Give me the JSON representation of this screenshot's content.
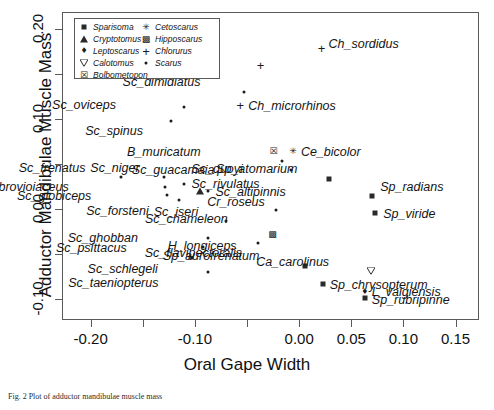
{
  "chart_data": {
    "type": "scatter",
    "title": "",
    "xlabel": "Oral Gape Width",
    "ylabel": "Adductor Mandibulae Muscle Mass",
    "xlim": [
      -0.2275,
      0.1725
    ],
    "ylim": [
      -0.1235,
      0.219
    ],
    "grid": false,
    "legend_position": "top-left",
    "xticks": [
      -0.2,
      -0.15,
      -0.1,
      -0.05,
      0.0,
      0.05,
      0.1,
      0.15
    ],
    "xticklabels": [
      "-0.20",
      "",
      "-0.10",
      "",
      "0.00",
      "0.05",
      "0.10",
      "0.15"
    ],
    "yticks": [
      -0.1,
      -0.05,
      0.0,
      0.05,
      0.1,
      0.15,
      0.2
    ],
    "yticklabels": [
      "-0.10",
      "",
      "0.00",
      "",
      "0.10",
      "",
      "0.20"
    ],
    "legend": [
      {
        "label": "Sparisoma",
        "marker": "square"
      },
      {
        "label": "Cryptotomus",
        "marker": "triangle"
      },
      {
        "label": "Leptoscarus",
        "marker": "diamond"
      },
      {
        "label": "Calotomus",
        "marker": "triangle-down"
      },
      {
        "label": "Bolbometopon",
        "marker": "crossed-square"
      },
      {
        "label": "Cetoscarus",
        "marker": "asterisk"
      },
      {
        "label": "Hipposcarus",
        "marker": "boxed-cross"
      },
      {
        "label": "Chlorurus",
        "marker": "plus"
      },
      {
        "label": "Scarus",
        "marker": "dot"
      }
    ],
    "points": [
      {
        "name": "Ch_sordidus",
        "genus": "Chlorurus",
        "marker": "plus",
        "x": 0.0215,
        "y": 0.179,
        "label_dx": 7,
        "label_dy": -4
      },
      {
        "name": "Ch_bleekeri",
        "genus": "Chlorurus",
        "marker": "plus",
        "x": -0.037,
        "y": 0.16,
        "label_dx": -80,
        "label_dy": -4
      },
      {
        "name": "Sc_dimidiatus",
        "genus": "Scarus",
        "marker": "dot",
        "x": -0.0525,
        "y": 0.1305,
        "label_dx": -44,
        "label_dy": -10
      },
      {
        "name": "Ch_microrhinos",
        "genus": "Chlorurus",
        "marker": "plus",
        "x": -0.0565,
        "y": 0.116,
        "label_dx": 8,
        "label_dy": 1
      },
      {
        "name": "Sc_oviceps",
        "genus": "Scarus",
        "marker": "dot",
        "x": -0.1105,
        "y": 0.1135,
        "label_dx": -68,
        "label_dy": -2
      },
      {
        "name": "Sc_spinus",
        "genus": "Scarus",
        "marker": "dot",
        "x": -0.123,
        "y": 0.0975,
        "label_dx": -28,
        "label_dy": 10
      },
      {
        "name": "B_muricatum",
        "genus": "Bolbometopon",
        "marker": "crossed-square",
        "x": -0.0245,
        "y": 0.0645,
        "label_dx": -73,
        "label_dy": 1
      },
      {
        "name": "Ce_bicolor",
        "genus": "Cetoscarus",
        "marker": "asterisk",
        "x": -0.006,
        "y": 0.0645,
        "label_dx": 8,
        "label_dy": 1
      },
      {
        "name": "Sc_guacamaia",
        "genus": "Scarus",
        "marker": "dot",
        "x": -0.016,
        "y": 0.053,
        "label_dx": -68,
        "label_dy": 9
      },
      {
        "name": "Sc_quoyi",
        "genus": "Scarus",
        "marker": "dot",
        "x": -0.008,
        "y": 0.043,
        "label_dx": -48,
        "label_dy": -1
      },
      {
        "name": "Sp_atomarium",
        "genus": "Sparisoma",
        "marker": "square",
        "x": 0.029,
        "y": 0.0335,
        "label_dx": -32,
        "label_dy": -10
      },
      {
        "name": "Sc_frenatus",
        "genus": "Scarus",
        "marker": "dot",
        "x": -0.1705,
        "y": 0.0355,
        "label_dx": -36,
        "label_dy": -9
      },
      {
        "name": "Sc_niger",
        "genus": "Scarus",
        "marker": "dot",
        "x": -0.13,
        "y": 0.0355,
        "label_dx": -24,
        "label_dy": -9
      },
      {
        "name": "Sc_rivulatus",
        "genus": "Scarus",
        "marker": "dot",
        "x": -0.11,
        "y": 0.028,
        "label_dx": 7,
        "label_dy": 0
      },
      {
        "name": "Sc_rubrovioiaceus",
        "genus": "Scarus",
        "marker": "dot",
        "x": -0.129,
        "y": 0.0245,
        "label_dx": -96,
        "label_dy": 0
      },
      {
        "name": "Sc_altipinnis",
        "genus": "Scarus",
        "marker": "dot",
        "x": -0.087,
        "y": 0.02,
        "label_dx": 7,
        "label_dy": 1
      },
      {
        "name": "Cr_roseus",
        "genus": "Cryptotomus",
        "marker": "triangle",
        "x": -0.095,
        "y": 0.0205,
        "label_dx": 7,
        "label_dy": 11
      },
      {
        "name": "Sc_globiceps",
        "genus": "Scarus",
        "marker": "dot",
        "x": -0.1265,
        "y": 0.0155,
        "label_dx": -76,
        "label_dy": 1
      },
      {
        "name": "Sc_forsteni",
        "genus": "Scarus",
        "marker": "dot",
        "x": -0.1155,
        "y": 0.01,
        "label_dx": -30,
        "label_dy": 11
      },
      {
        "name": "Sp_radians",
        "genus": "Sparisoma",
        "marker": "square",
        "x": 0.07,
        "y": 0.0145,
        "label_dx": 8,
        "label_dy": -9
      },
      {
        "name": "Sc_chameleon",
        "genus": "Scarus",
        "marker": "dot",
        "x": -0.0225,
        "y": -0.0015,
        "label_dx": -48,
        "label_dy": 9
      },
      {
        "name": "Sp_viride",
        "genus": "Sparisoma",
        "marker": "square",
        "x": 0.073,
        "y": -0.0045,
        "label_dx": 8,
        "label_dy": 1
      },
      {
        "name": "Sc_iseri",
        "genus": "Scarus",
        "marker": "dot",
        "x": -0.07,
        "y": -0.013,
        "label_dx": -28,
        "label_dy": -9
      },
      {
        "name": "H_longiceps",
        "genus": "Hipposcarus",
        "marker": "boxed-cross",
        "x": -0.0255,
        "y": -0.0275,
        "label_dx": -36,
        "label_dy": 12
      },
      {
        "name": "Sc_ghobban",
        "genus": "Scarus",
        "marker": "dot",
        "x": -0.0875,
        "y": -0.0325,
        "label_dx": -70,
        "label_dy": 0
      },
      {
        "name": "Sc_flavipectoralis",
        "genus": "Scarus",
        "marker": "dot",
        "x": -0.0395,
        "y": -0.0375,
        "label_dx": -16,
        "label_dy": 10
      },
      {
        "name": "Sc_psittacus",
        "genus": "Scarus",
        "marker": "dot",
        "x": -0.0925,
        "y": -0.0425,
        "label_dx": -76,
        "label_dy": 1
      },
      {
        "name": "Sp_aurofrenatum",
        "genus": "Sparisoma",
        "marker": "square",
        "x": 0.006,
        "y": -0.064,
        "label_dx": -46,
        "label_dy": -10
      },
      {
        "name": "Sc_schlegeli",
        "genus": "Scarus",
        "marker": "dot",
        "x": -0.103,
        "y": -0.054,
        "label_dx": -34,
        "label_dy": 11
      },
      {
        "name": "Ca_carolinus",
        "genus": "Calotomus",
        "marker": "triangle-down",
        "x": 0.069,
        "y": -0.0695,
        "label_dx": -42,
        "label_dy": -9
      },
      {
        "name": "Sc_taeniopterus",
        "genus": "Scarus",
        "marker": "dot",
        "x": -0.087,
        "y": -0.07,
        "label_dx": -50,
        "label_dy": 11
      },
      {
        "name": "Sp_chrysopterum",
        "genus": "Sparisoma",
        "marker": "square",
        "x": 0.0225,
        "y": -0.084,
        "label_dx": 7,
        "label_dy": 1
      },
      {
        "name": "L_vaigiensis",
        "genus": "Leptoscarus",
        "marker": "diamond",
        "x": 0.063,
        "y": -0.092,
        "label_dx": 7,
        "label_dy": 0
      },
      {
        "name": "Sp_rubripinne",
        "genus": "Sparisoma",
        "marker": "square",
        "x": 0.063,
        "y": -0.0995,
        "label_dx": 7,
        "label_dy": 2
      }
    ]
  },
  "caption": {
    "text": "Fig. 2 Plot of adductor mandibulae muscle mass"
  },
  "colors": {
    "axis": "#5a5a5a",
    "text": "#141414",
    "marker": "#2a2a2a"
  }
}
